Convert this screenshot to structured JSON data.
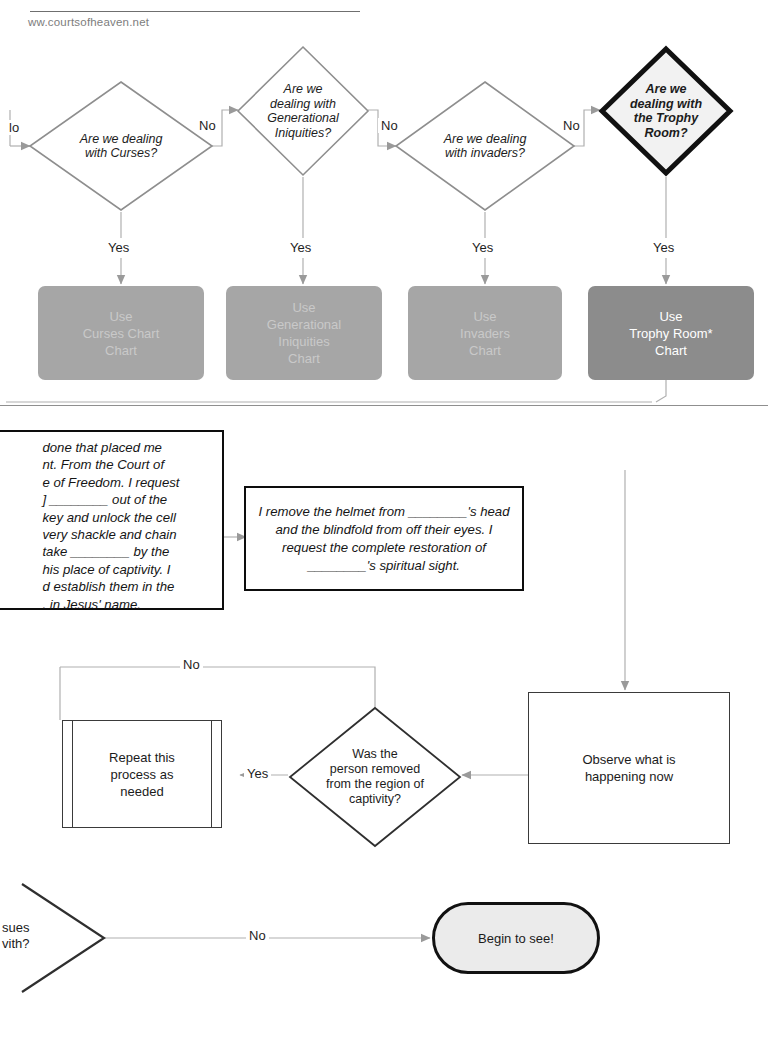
{
  "header": {
    "ghost_line": "",
    "site_url": "ww.courtsofheaven.net"
  },
  "decisions_row": [
    {
      "id": "curses",
      "label": "Are we dealing\nwith Curses?",
      "no_label": "No",
      "yes_label": "Yes",
      "emphasis": false
    },
    {
      "id": "generational",
      "label": "Are we\ndealing with\nGenerational\nIniquities?",
      "no_label": "No",
      "yes_label": "Yes",
      "emphasis": false
    },
    {
      "id": "invaders",
      "label": "Are we dealing\nwith invaders?",
      "no_label": "No",
      "yes_label": "Yes",
      "emphasis": false
    },
    {
      "id": "trophy",
      "label": "Are we\ndealing with\nthe Trophy\nRoom?",
      "no_label": "No",
      "yes_label": "Yes",
      "emphasis": true
    }
  ],
  "incoming_no_label": "lo",
  "chart_boxes": [
    {
      "id": "curses-chart",
      "label": "Use\nCurses Chart\nChart",
      "style": "light"
    },
    {
      "id": "generational-chart",
      "label": "Use\nGenerational\nIniquities\nChart",
      "style": "light"
    },
    {
      "id": "invaders-chart",
      "label": "Use\nInvaders\nChart",
      "style": "light"
    },
    {
      "id": "trophy-chart",
      "label": "Use\nTrophy Room*\nChart",
      "style": "dark"
    }
  ],
  "prayer_boxes": {
    "left_clipped": "done that placed me\nnt. From the Court of\ne of Freedom. I request\n] ________ out of the\nkey and unlock the cell\nvery shackle and chain\ntake ________ by the\nhis place of captivity. I\nd establish them in the\n. in Jesus' name.",
    "center": "I remove the helmet from ________'s head and the blindfold from off their eyes. I request the complete restoration of ________'s spiritual sight."
  },
  "loop_section": {
    "no_label": "No",
    "yes_label": "Yes",
    "repeat_box": "Repeat this\nprocess as\nneeded",
    "decision": "Was the\nperson removed\nfrom the region of\ncaptivity?",
    "observe_box": "Observe what is\nhappening now"
  },
  "bottom_section": {
    "clipped_decision": "sues\nvith?",
    "no_label": "No",
    "terminator": "Begin to see!"
  },
  "colors": {
    "chart_light": "#a6a6a6",
    "chart_light_text": "#c9c9c9",
    "chart_dark": "#8c8c8c",
    "chart_dark_text": "#ffffff",
    "connector": "#a8a8a8",
    "outline": "#3a3a3a",
    "emphasis_outline": "#111111",
    "terminator_fill": "#ebebeb"
  }
}
